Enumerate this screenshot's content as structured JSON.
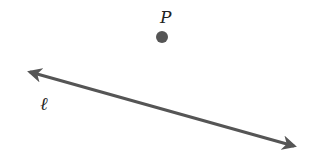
{
  "diagram": {
    "point": {
      "label": "P",
      "cx": 162,
      "cy": 37,
      "r": 6,
      "color": "#555555"
    },
    "line": {
      "label": "ℓ",
      "x1": 23,
      "y1": 70,
      "x2": 301,
      "y2": 148,
      "color": "#555555",
      "arrows": "both"
    },
    "labels": {
      "point_label_pos": [
        165,
        20
      ],
      "line_label_pos": [
        44,
        108
      ]
    }
  }
}
